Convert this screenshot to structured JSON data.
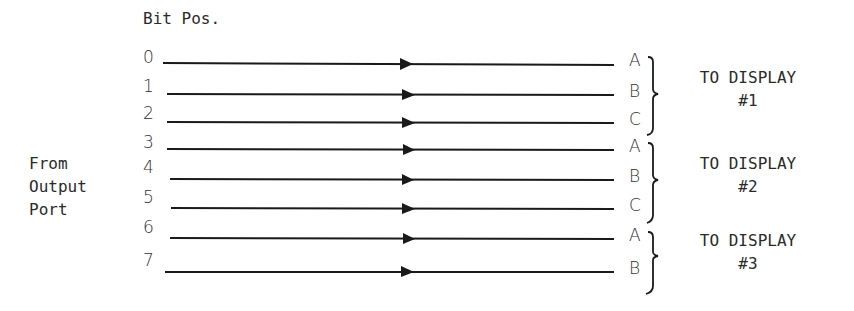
{
  "header": {
    "label": "Bit Pos."
  },
  "source": {
    "lines": [
      "From",
      "Output",
      "Port"
    ]
  },
  "bits": [
    {
      "bit": "0",
      "segment": "A",
      "y": 63
    },
    {
      "bit": "1",
      "segment": "B",
      "y": 94
    },
    {
      "bit": "2",
      "segment": "C",
      "y": 122
    },
    {
      "bit": "3",
      "segment": "A",
      "y": 149
    },
    {
      "bit": "4",
      "segment": "B",
      "y": 179
    },
    {
      "bit": "5",
      "segment": "C",
      "y": 208
    },
    {
      "bit": "6",
      "segment": "A",
      "y": 238
    },
    {
      "bit": "7",
      "segment": "B",
      "y": 272
    }
  ],
  "displays": [
    {
      "label": "TO DISPLAY",
      "number": "#1"
    },
    {
      "label": "TO DISPLAY",
      "number": "#2"
    },
    {
      "label": "TO DISPLAY",
      "number": "#3"
    }
  ],
  "colors": {
    "line": "#1a1a1a",
    "text": "#2a2a2a"
  }
}
